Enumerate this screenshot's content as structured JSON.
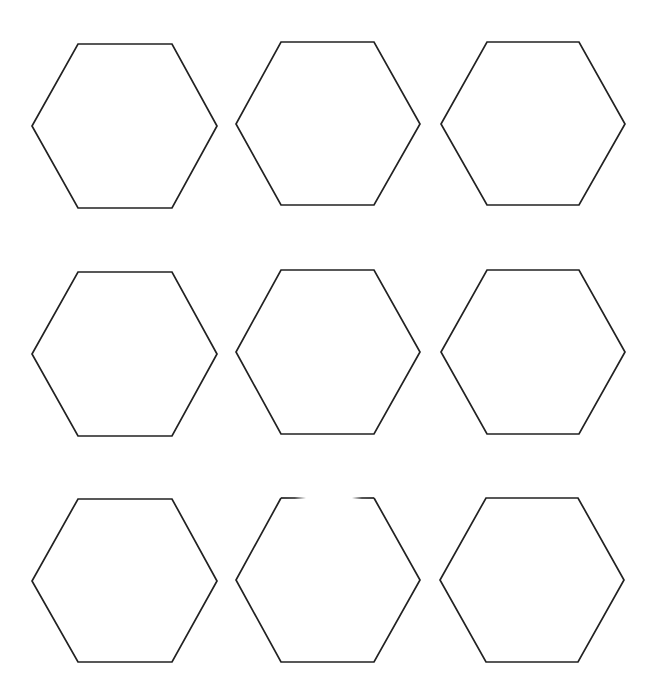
{
  "canvas": {
    "width": 655,
    "height": 700,
    "background": "#ffffff"
  },
  "style": {
    "stroke": "#222222",
    "stroke_width": 1.7
  },
  "grid": {
    "rows": 3,
    "cols": 3
  },
  "hexagons": [
    {
      "id": "r1c1",
      "points": [
        [
          78,
          44
        ],
        [
          172,
          44
        ],
        [
          217,
          126
        ],
        [
          172,
          208
        ],
        [
          78,
          208
        ],
        [
          32,
          126
        ]
      ]
    },
    {
      "id": "r1c2",
      "points": [
        [
          281,
          42
        ],
        [
          374,
          42
        ],
        [
          420,
          124
        ],
        [
          374,
          205
        ],
        [
          281,
          205
        ],
        [
          236,
          124
        ]
      ]
    },
    {
      "id": "r1c3",
      "points": [
        [
          487,
          42
        ],
        [
          579,
          42
        ],
        [
          625,
          124
        ],
        [
          579,
          205
        ],
        [
          487,
          205
        ],
        [
          441,
          124
        ]
      ]
    },
    {
      "id": "r2c1",
      "points": [
        [
          78,
          272
        ],
        [
          172,
          272
        ],
        [
          217,
          354
        ],
        [
          172,
          436
        ],
        [
          78,
          436
        ],
        [
          32,
          354
        ]
      ]
    },
    {
      "id": "r2c2",
      "points": [
        [
          281,
          270
        ],
        [
          374,
          270
        ],
        [
          420,
          352
        ],
        [
          374,
          434
        ],
        [
          281,
          434
        ],
        [
          236,
          352
        ]
      ]
    },
    {
      "id": "r2c3",
      "points": [
        [
          487,
          270
        ],
        [
          579,
          270
        ],
        [
          625,
          352
        ],
        [
          579,
          434
        ],
        [
          487,
          434
        ],
        [
          441,
          352
        ]
      ]
    },
    {
      "id": "r3c1",
      "points": [
        [
          78,
          499
        ],
        [
          172,
          499
        ],
        [
          217,
          581
        ],
        [
          172,
          662
        ],
        [
          78,
          662
        ],
        [
          32,
          581
        ]
      ]
    },
    {
      "id": "r3c2",
      "points": [
        [
          281,
          498
        ],
        [
          374,
          498
        ],
        [
          420,
          580
        ],
        [
          374,
          662
        ],
        [
          281,
          662
        ],
        [
          236,
          580
        ]
      ],
      "top_edge_gap": [
        306,
        352
      ]
    },
    {
      "id": "r3c3",
      "points": [
        [
          486,
          498
        ],
        [
          578,
          498
        ],
        [
          624,
          580
        ],
        [
          578,
          662
        ],
        [
          486,
          662
        ],
        [
          440,
          580
        ]
      ]
    }
  ]
}
